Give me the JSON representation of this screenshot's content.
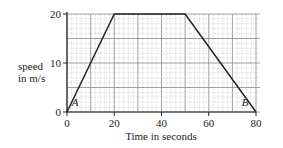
{
  "chart_data": {
    "type": "line",
    "title": "",
    "xlabel": "Time in seconds",
    "ylabel": "speed in m/s",
    "ylabel_lines": [
      "speed",
      "in m/s"
    ],
    "xlim": [
      0,
      80
    ],
    "ylim": [
      0,
      20
    ],
    "xticks": [
      0,
      20,
      40,
      60,
      80
    ],
    "xtick_labels": [
      "0",
      "20",
      "40",
      "60",
      "80"
    ],
    "yticks": [
      0,
      10,
      20
    ],
    "ytick_labels": [
      "0",
      "10",
      "20"
    ],
    "grid": true,
    "series": [
      {
        "name": "speed-time",
        "x": [
          0,
          20,
          50,
          80
        ],
        "y": [
          0,
          20,
          20,
          0
        ]
      }
    ],
    "annotations": [
      {
        "text": "A",
        "x": 2,
        "y": 1
      },
      {
        "text": "B",
        "x": 74,
        "y": 1
      }
    ]
  }
}
